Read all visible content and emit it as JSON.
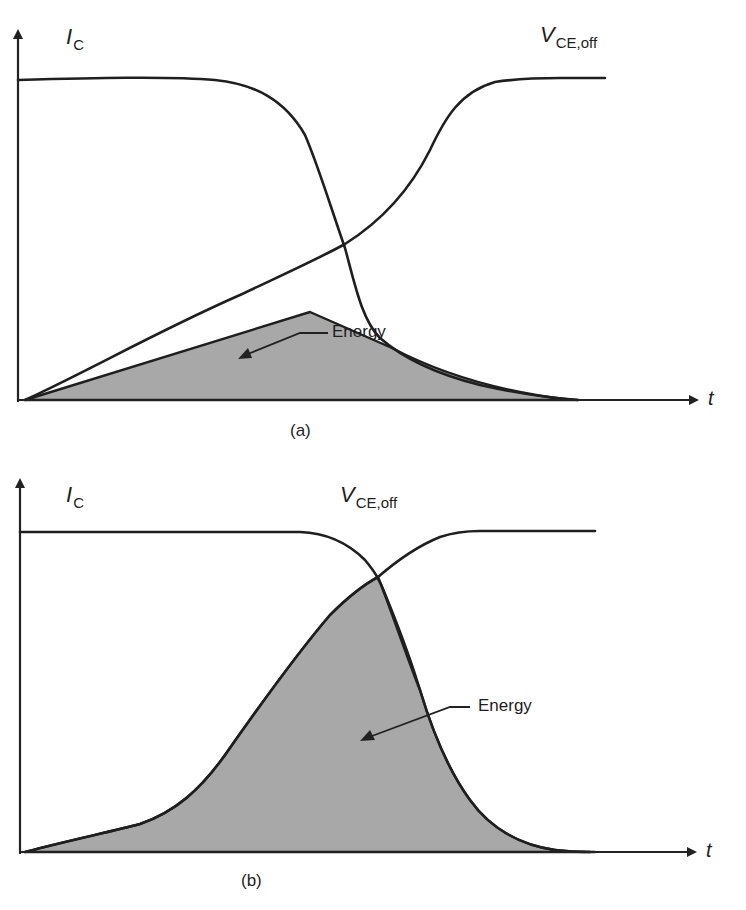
{
  "figure": {
    "fill_color": "#a8a8a8",
    "line_color": "#1f1f1f",
    "panels": [
      {
        "id": "a",
        "panel_label": "(a)",
        "current_label": {
          "symbol": "I",
          "subscript": "C"
        },
        "voltage_label": {
          "symbol": "V",
          "subscript": "CE,off"
        },
        "energy_label": "Energy",
        "x_axis_label": "t"
      },
      {
        "id": "b",
        "panel_label": "(b)",
        "current_label": {
          "symbol": "I",
          "subscript": "C"
        },
        "voltage_label": {
          "symbol": "V",
          "subscript": "CE,off"
        },
        "energy_label": "Energy",
        "x_axis_label": "t"
      }
    ]
  }
}
